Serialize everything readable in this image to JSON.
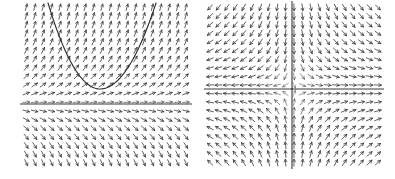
{
  "figure": {
    "title": "",
    "panel_count": 2,
    "background_color": "#ffffff",
    "ink_color": "#3a3a3a",
    "curve_color": "#2e2e2e"
  },
  "panels": [
    {
      "id": "left-panel",
      "name": "direction-field-with-solution-curve",
      "label": "",
      "plot_box": {
        "x": 22,
        "y": 3,
        "width": 168,
        "height": 164
      },
      "grid": {
        "columns": 20,
        "rows": 19,
        "spacing_x": 8.4,
        "spacing_y": 8.6
      },
      "axes": {
        "xlim": [
          -3,
          3
        ],
        "ylim": [
          -3,
          3
        ],
        "show_frame": false,
        "grid": false
      },
      "features": [
        {
          "type": "equilibrium-line",
          "name": "horizontal-equilibrium-line",
          "orientation": "horizontal",
          "y_pixel": 104,
          "y_value": 0
        },
        {
          "type": "solution-curve",
          "name": "parabola-solution-curve",
          "shape": "parabola",
          "vertex_pixel": [
            100,
            89
          ],
          "left_end_pixel": [
            48,
            3
          ],
          "right_end_pixel": [
            156,
            3
          ]
        }
      ],
      "field": {
        "name": "slope-field-left",
        "description": "arrow directions vary smoothly; upward-right above the equilibrium line, rightward along it, and right-and-up below it"
      }
    },
    {
      "id": "right-panel",
      "name": "direction-field-saddle-point",
      "label": "",
      "plot_box": {
        "x": 206,
        "y": 3,
        "width": 176,
        "height": 164
      },
      "grid": {
        "columns": 21,
        "rows": 19,
        "spacing_x": 8.4,
        "spacing_y": 8.6
      },
      "axes": {
        "xlim": [
          -3,
          3
        ],
        "ylim": [
          -3,
          3
        ],
        "show_frame": false,
        "grid": false
      },
      "features": [
        {
          "type": "separatrix",
          "name": "horizontal-separatrix",
          "orientation": "horizontal",
          "y_pixel": 89,
          "y_value": 0
        },
        {
          "type": "separatrix",
          "name": "vertical-separatrix",
          "orientation": "vertical",
          "x_pixel": 292,
          "x_value": 0
        },
        {
          "type": "critical-point",
          "name": "saddle-point",
          "pixel": [
            292,
            89
          ],
          "value": [
            0,
            0
          ]
        }
      ],
      "field": {
        "name": "slope-field-right",
        "description": "saddle pattern: trajectories approach along one separatrix and depart along the other, forming four hyperbolic quadrants"
      }
    }
  ],
  "chart_data": {
    "type": "scatter",
    "title": "",
    "xlabel": "",
    "ylabel": "",
    "subplots": [
      {
        "name": "left",
        "type": "direction-field",
        "xlim": [
          -3,
          3
        ],
        "ylim": [
          -3,
          3
        ],
        "grid": false,
        "annotations": [
          "parabola solution curve",
          "horizontal equilibrium line at y = 0"
        ]
      },
      {
        "name": "right",
        "type": "direction-field",
        "xlim": [
          -3,
          3
        ],
        "ylim": [
          -3,
          3
        ],
        "grid": false,
        "annotations": [
          "saddle point at (0, 0)",
          "horizontal separatrix",
          "vertical separatrix"
        ]
      }
    ]
  }
}
